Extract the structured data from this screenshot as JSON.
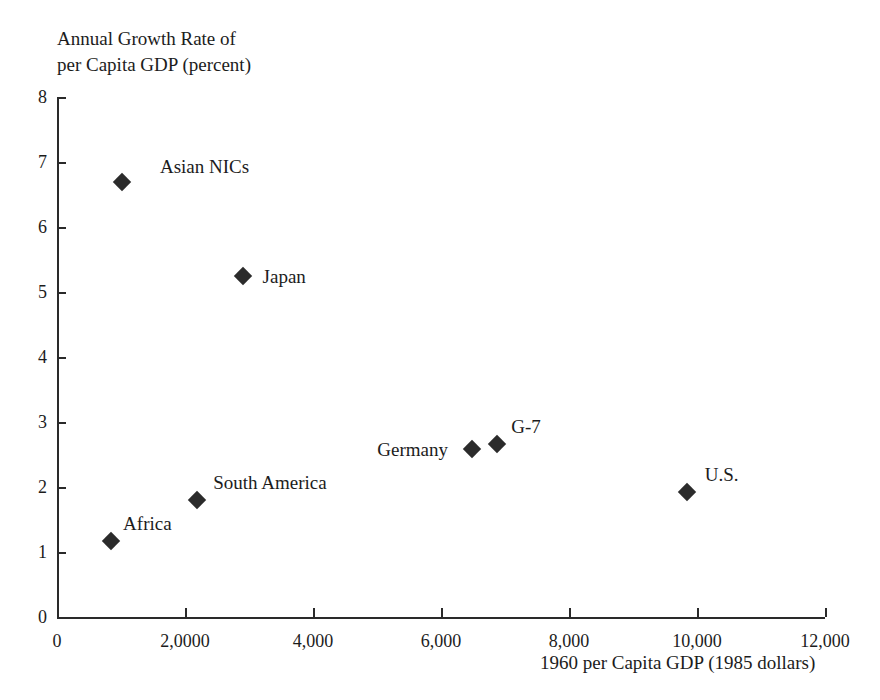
{
  "chart_data": {
    "type": "scatter",
    "title": "",
    "ylabel_line1": "Annual Growth Rate of",
    "ylabel_line2": "per Capita GDP (percent)",
    "xlabel": "1960 per Capita GDP (1985 dollars)",
    "xlim": [
      0,
      12000
    ],
    "ylim": [
      0,
      8
    ],
    "grid": false,
    "legend": "none",
    "x_ticks": [
      0,
      2000,
      4000,
      6000,
      8000,
      10000,
      12000
    ],
    "x_ticklabels": [
      "0",
      "2,0000",
      "4,000",
      "6,000",
      "8,000",
      "10,000",
      "12,000"
    ],
    "y_ticks": [
      0,
      1,
      2,
      3,
      4,
      5,
      6,
      7,
      8
    ],
    "y_ticklabels": [
      "0",
      "1",
      "2",
      "3",
      "4",
      "5",
      "6",
      "7",
      "8"
    ],
    "marker": "diamond",
    "marker_color": "#2b2b2b",
    "points": [
      {
        "label": "Asian NICs",
        "x": 1015,
        "y": 6.7,
        "label_dx": 38,
        "label_dy": -26
      },
      {
        "label": "Japan",
        "x": 2900,
        "y": 5.25,
        "label_dx": 20,
        "label_dy": -10
      },
      {
        "label": "G-7",
        "x": 6880,
        "y": 2.66,
        "label_dx": 14,
        "label_dy": -28
      },
      {
        "label": "Germany",
        "x": 6490,
        "y": 2.58,
        "label_dx": -95,
        "label_dy": -10
      },
      {
        "label": "U.S.",
        "x": 9840,
        "y": 1.93,
        "label_dx": 18,
        "label_dy": -28
      },
      {
        "label": "South America",
        "x": 2190,
        "y": 1.8,
        "label_dx": 16,
        "label_dy": -28
      },
      {
        "label": "Africa",
        "x": 845,
        "y": 1.17,
        "label_dx": 12,
        "label_dy": -28
      }
    ]
  }
}
